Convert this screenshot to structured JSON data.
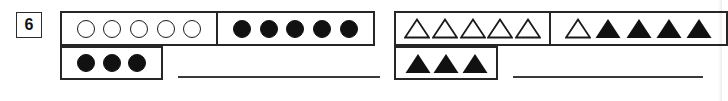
{
  "worksheet": {
    "problem_number": "6",
    "colors": {
      "ink": "#262626",
      "fill": "#111111",
      "paper": "#ffffff"
    },
    "rows": [
      {
        "name": "circles-row",
        "groups": [
          {
            "name": "open-circles-group",
            "shape": "circle",
            "fill": "open",
            "count": 5,
            "count_label": "5"
          },
          {
            "name": "filled-circles-group",
            "shape": "circle",
            "fill": "filled",
            "count": 5,
            "count_label": "5"
          }
        ],
        "remainder": {
          "name": "leftover-circles-group",
          "shape": "circle",
          "fill": "filled",
          "count": 3,
          "count_label": "3"
        },
        "answer_value": "",
        "answer_placeholder": ""
      },
      {
        "name": "triangles-row",
        "groups": [
          {
            "name": "open-triangles-group",
            "shape": "triangle",
            "fill": "open",
            "count": 5,
            "count_label": "5"
          },
          {
            "name": "mixed-triangles-group",
            "shape": "triangle",
            "fill": "mixed",
            "count": 5,
            "count_label": "5",
            "pattern": [
              "open",
              "filled",
              "filled",
              "filled",
              "filled"
            ]
          }
        ],
        "remainder": {
          "name": "leftover-triangles-group",
          "shape": "triangle",
          "fill": "filled",
          "count": 3,
          "count_label": "3"
        },
        "answer_value": "",
        "answer_placeholder": ""
      }
    ]
  }
}
